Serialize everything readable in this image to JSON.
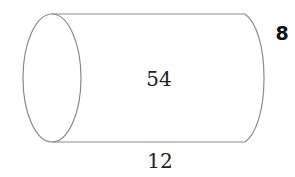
{
  "diagram": {
    "shape": "cylinder",
    "orientation": "horizontal",
    "labels": {
      "center": "54",
      "bottom": "12",
      "right": "8"
    },
    "colors": {
      "stroke": "#8a8a8a",
      "text": "#222222",
      "background": "#ffffff"
    }
  }
}
